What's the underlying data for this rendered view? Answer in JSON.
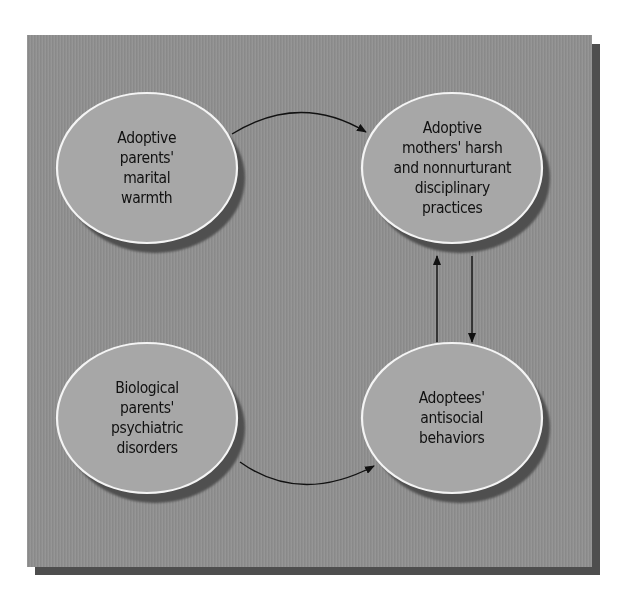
{
  "diagram": {
    "type": "causal-path-diagram",
    "colors": {
      "panel_background": "#8f8f8f",
      "panel_shadow": "#4e4e4e",
      "node_fill": "#a7a7a7",
      "node_border": "#f4f4f4",
      "node_shadow": "#505050",
      "arrow": "#111111",
      "text": "#111111"
    },
    "nodes": [
      {
        "id": "adoptive-marital-warmth",
        "label": "Adoptive\nparents'\nmarital\nwarmth",
        "position": "top-left"
      },
      {
        "id": "mothers-harsh-discipline",
        "label": "Adoptive\nmothers' harsh\nand nonnurturant\ndisciplinary\npractices",
        "position": "top-right"
      },
      {
        "id": "biological-psychiatric-disorders",
        "label": "Biological\nparents'\npsychiatric\ndisorders",
        "position": "bottom-left"
      },
      {
        "id": "adoptees-antisocial-behaviors",
        "label": "Adoptees'\nantisocial\nbehaviors",
        "position": "bottom-right"
      }
    ],
    "edges": [
      {
        "from": "adoptive-marital-warmth",
        "to": "mothers-harsh-discipline",
        "shape": "arc-up"
      },
      {
        "from": "biological-psychiatric-disorders",
        "to": "adoptees-antisocial-behaviors",
        "shape": "arc-down"
      },
      {
        "from": "adoptees-antisocial-behaviors",
        "to": "mothers-harsh-discipline",
        "shape": "straight-up"
      },
      {
        "from": "mothers-harsh-discipline",
        "to": "adoptees-antisocial-behaviors",
        "shape": "straight-down"
      }
    ]
  }
}
